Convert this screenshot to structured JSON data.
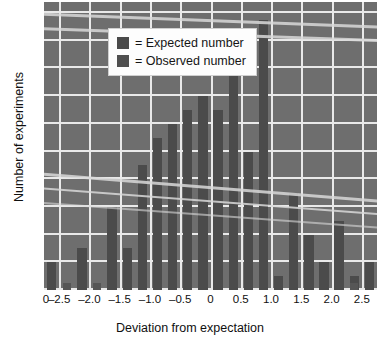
{
  "legend": {
    "position": "top-left-inside",
    "items": [
      {
        "key": "expected",
        "label": "= Expected number",
        "color": "#4a4a4a"
      },
      {
        "key": "observed",
        "label": "= Observed number",
        "color": "#4f4f4f"
      }
    ]
  },
  "axes": {
    "xlabel": "Deviation from expectation",
    "ylabel": "Number of experiments",
    "origin_label": "0",
    "xticks": [
      "-2.5",
      "-2.0",
      "-1.5",
      "-1.0",
      "-0.5",
      "0",
      "0.5",
      "1.0",
      "1.5",
      "2.0",
      "2.5"
    ],
    "yticks": [
      "0",
      "2",
      "4",
      "6",
      "8",
      "10",
      "12",
      "14",
      "16",
      "18",
      "20"
    ]
  },
  "colors": {
    "plot_background": "#6e6e6e",
    "gridline": "#e9e9e9",
    "observed_bar": "#4b4b4b",
    "expected_bar": "#565656",
    "text": "#101010",
    "legend_background": "#fdfdfd"
  },
  "chart_data": {
    "type": "bar",
    "title": "",
    "xlabel": "Deviation from expectation",
    "ylabel": "Number of experiments",
    "xlim": [
      -2.75,
      2.75
    ],
    "ylim": [
      0,
      20.8
    ],
    "grid": true,
    "legend_position": "upper left",
    "categories": [
      "-2.625",
      "-2.375",
      "-2.125",
      "-1.875",
      "-1.625",
      "-1.375",
      "-1.125",
      "-0.875",
      "-0.625",
      "-0.375",
      "-0.125",
      "0.125",
      "0.375",
      "0.625",
      "0.875",
      "1.125",
      "1.375",
      "1.625",
      "1.875",
      "2.125",
      "2.375",
      "2.625"
    ],
    "series": [
      {
        "name": "Observed number",
        "color": "#4b4b4b",
        "values": [
          2,
          0,
          3,
          0,
          6,
          3,
          9,
          11,
          12,
          13,
          14,
          13,
          16,
          10,
          19.5,
          1,
          7,
          4,
          2,
          5,
          1,
          2
        ]
      },
      {
        "name": "Expected number",
        "color": "#565656",
        "values": [
          0,
          0.5,
          0,
          0.5,
          0,
          0,
          0,
          0,
          0,
          0,
          0,
          0,
          0,
          0,
          0,
          0,
          0,
          0,
          0,
          0,
          0.5,
          0
        ]
      }
    ]
  }
}
